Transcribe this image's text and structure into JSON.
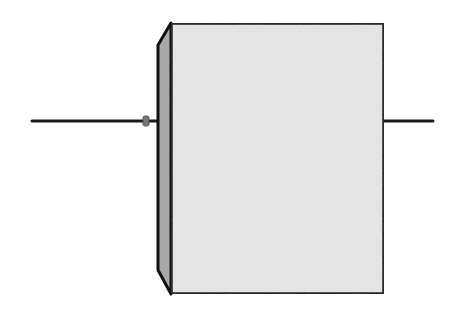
{
  "diagram": {
    "description": "Side-profile line drawing of a box-shaped component with axial leads on either side",
    "component": {
      "type": "block-with-axial-leads",
      "front_face": {
        "x": 171,
        "y": 23,
        "width": 213,
        "height": 271,
        "fill": "#e6e6e6",
        "stroke": "#111111"
      },
      "side_bevel": {
        "fill": "#a9a9a9",
        "stroke": "#111111"
      },
      "left_lead": {
        "x1": 32,
        "x2": 160,
        "y": 121,
        "stroke": "#1a1a1a"
      },
      "right_lead": {
        "x1": 384,
        "x2": 433,
        "y": 121,
        "stroke": "#1a1a1a"
      },
      "lead_bead": {
        "cx": 146,
        "cy": 121,
        "fill": "#777777"
      }
    },
    "colors": {
      "background": "#ffffff",
      "outline": "#111111",
      "face": "#e6e6e6",
      "bevel": "#a9a9a9"
    }
  }
}
